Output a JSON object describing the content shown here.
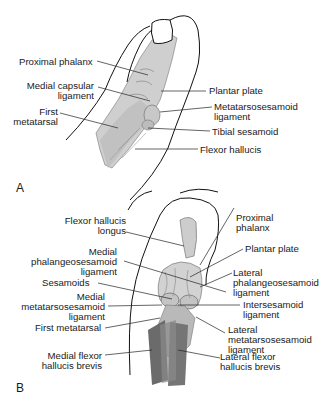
{
  "figure": {
    "panels": [
      {
        "letter": "A",
        "labels": {
          "proximal_phalanx": "Proximal phalanx",
          "medial_capsular_ligament": "Medial capsular\nligament",
          "first_metatarsal": "First\nmetatarsal",
          "plantar_plate": "Plantar plate",
          "metatarsosesamoid_ligament": "Metatarsosesamoid\nligament",
          "tibial_sesamoid": "Tibial sesamoid",
          "flexor_hallucis": "Flexor hallucis"
        }
      },
      {
        "letter": "B",
        "labels": {
          "flexor_hallucis_longus": "Flexor hallucis\nlongus",
          "medial_phalangeosesamoid_ligament": "Medial\nphalangeosesamoid\nligament",
          "sesamoids": "Sesamoids",
          "medial_metatarsosesamoid_ligament": "Medial\nmetatarsosesamoid\nligament",
          "first_metatarsal": "First metatarsal",
          "medial_flexor_hallucis_brevis": "Medial flexor\nhallucis brevis",
          "proximal_phalanx": "Proximal\nphalanx",
          "plantar_plate": "Plantar plate",
          "lateral_phalangeosesamoid_ligament": "Lateral\nphalangeosesamoid\nligament",
          "intersesamoid_ligament": "Intersesamoid\nligament",
          "lateral_metatarsosesamoid_ligament": "Lateral\nmetatarsosesamoid\nligament",
          "lateral_flexor_hallucis_brevis": "Lateral flexor\nhallucis brevis"
        }
      }
    ],
    "colors": {
      "outline": "#111111",
      "bone_light": "#d6d6d6",
      "bone_mid": "#b8b8b8",
      "muscle_dark": "#6e6e6e",
      "leader": "#222222"
    }
  }
}
